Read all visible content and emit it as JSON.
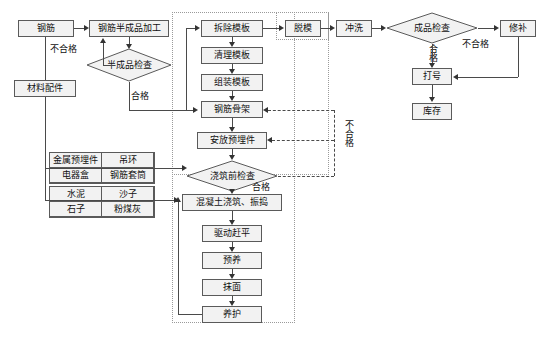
{
  "diagram": {
    "type": "process-flowchart",
    "language": "zh-CN"
  },
  "nodes": {
    "gangjin": "钢筋",
    "gangjin_banchengpin_jiagong": "钢筋半成品加工",
    "cailiao_peijian": "材料配件",
    "chaichu_muban": "拆除模板",
    "qingli_muban": "清理模板",
    "zuzhuang_muban": "组装模板",
    "gangjin_gujia": "钢筋骨架",
    "anfang_yumaijian": "安放预埋件",
    "hunningtu_jiaozhu": "混凝土浇筑、振捣",
    "qudong_ganping": "驱动赶平",
    "yuyang": "预养",
    "momian": "抹面",
    "yanghu": "养护",
    "tuomo": "脱模",
    "chongxi": "冲洗",
    "xiubu": "修补",
    "dahao": "打号",
    "kucun": "库存"
  },
  "decisions": {
    "banchengpin_jiancha": "半成品检查",
    "jiaozhuqian_jiancha": "浇筑前检查",
    "chengpin_jiancha": "成品检查"
  },
  "material_table": {
    "rows": [
      [
        "金属预埋件",
        "吊环"
      ],
      [
        "电器盒",
        "钢筋套筒"
      ],
      [
        "水泥",
        "沙子"
      ],
      [
        "石子",
        "粉煤灰"
      ]
    ]
  },
  "edge_labels": {
    "buhege_1": "不合格",
    "hege_1": "合格",
    "buhege_2": "不合格",
    "hege_2": "合格",
    "hege_3": "合格",
    "buhege_3": "不合格"
  },
  "colors": {
    "node_fill": "#f2f2f2",
    "node_border": "#5a5a5a",
    "connector": "#4a4a4a",
    "region_border": "#9a9a9a",
    "text": "#111111",
    "background": "#ffffff"
  }
}
